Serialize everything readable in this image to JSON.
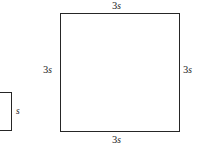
{
  "figure": {
    "background_color": "#ffffff",
    "stroke_color": "#262626",
    "text_color": "#1a1a1a"
  },
  "shapes": {
    "small_square": {
      "name": "small square",
      "side_label_coefficient": "",
      "side_label_variable": "s",
      "labels": {
        "right": {
          "coefficient": "",
          "variable": "s"
        }
      }
    },
    "large_square": {
      "name": "large square",
      "side_label_coefficient": "3",
      "side_label_variable": "s",
      "labels": {
        "top": {
          "coefficient": "3",
          "variable": "s"
        },
        "left": {
          "coefficient": "3",
          "variable": "s"
        },
        "right": {
          "coefficient": "3",
          "variable": "s"
        },
        "bottom": {
          "coefficient": "3",
          "variable": "s"
        }
      }
    }
  }
}
